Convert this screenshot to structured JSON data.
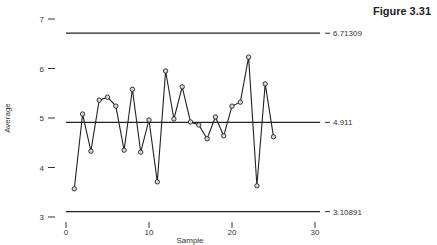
{
  "figure_title": "Figure 3.31",
  "chart_data": {
    "type": "line",
    "title": "",
    "xlabel": "Sample",
    "ylabel": "Average",
    "xlim": [
      0,
      30
    ],
    "ylim": [
      3,
      7
    ],
    "xticks": [
      0,
      10,
      20,
      30
    ],
    "yticks": [
      3,
      4,
      5,
      6,
      7
    ],
    "grid": false,
    "legend": "none",
    "series": [
      {
        "name": "Average",
        "x": [
          1,
          2,
          3,
          4,
          5,
          6,
          7,
          8,
          9,
          10,
          11,
          12,
          13,
          14,
          15,
          16,
          17,
          18,
          19,
          20,
          21,
          22,
          23,
          24,
          25
        ],
        "values": [
          3.57,
          5.08,
          4.33,
          5.36,
          5.42,
          5.24,
          4.35,
          5.58,
          4.31,
          4.96,
          3.71,
          5.95,
          4.98,
          5.63,
          4.92,
          4.86,
          4.58,
          5.02,
          4.64,
          5.24,
          5.32,
          6.23,
          3.63,
          5.69,
          4.62
        ]
      }
    ],
    "reference_lines": [
      {
        "name": "UCL",
        "value": 6.71309,
        "label": "6.71309"
      },
      {
        "name": "CL",
        "value": 4.911,
        "label": "4.911"
      },
      {
        "name": "LCL",
        "value": 3.10891,
        "label": "3.10891"
      }
    ]
  }
}
